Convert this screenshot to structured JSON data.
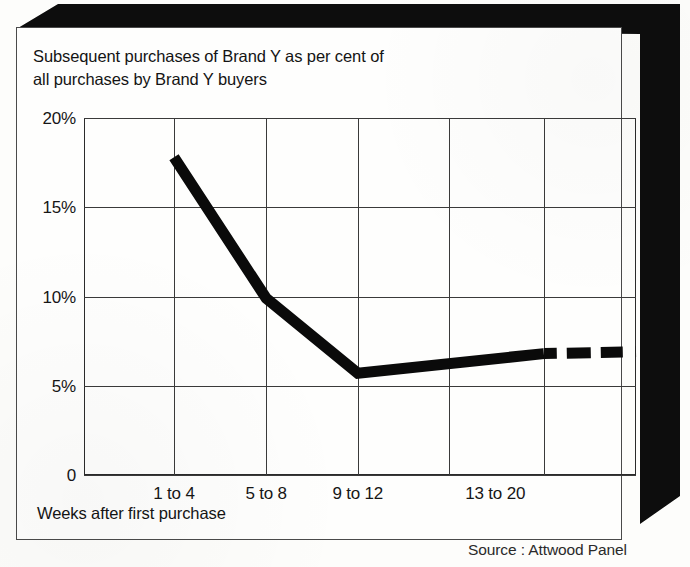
{
  "title": {
    "line1": "Subsequent purchases of Brand Y as per cent of",
    "line2": "all purchases by Brand Y buyers"
  },
  "axis_caption": "Weeks after first purchase",
  "source": "Source : Attwood Panel",
  "colors": {
    "series": "#0a0a0a",
    "grid": "#3a3a3a",
    "frame": "#2b2b2b",
    "card": "#fefefd",
    "shadow": "#0d0d0d",
    "text": "#141414"
  },
  "chart_data": {
    "type": "line",
    "title": "Subsequent purchases of Brand Y as per cent of all purchases by Brand Y buyers",
    "xlabel": "Weeks after first purchase",
    "ylabel": "",
    "source": "Source : Attwood Panel",
    "grid": true,
    "legend": "none",
    "ylim": [
      0,
      20
    ],
    "yticks": [
      0,
      5,
      10,
      15,
      20
    ],
    "ytick_labels": [
      "0",
      "5%",
      "10%",
      "15%",
      "20%"
    ],
    "categories": [
      "1 to 4",
      "5 to 8",
      "9 to 12",
      "13 to 20"
    ],
    "xtick_positions_pct": [
      16.3,
      33.0,
      49.6,
      74.5
    ],
    "gridline_positions_pct": [
      0,
      16.3,
      33.0,
      49.6,
      66.1,
      83.3,
      100
    ],
    "series": [
      {
        "name": "Brand Y repeat purchase rate",
        "style": "thick-solid-with-dashed-projection",
        "points": [
          {
            "x_pct": 16.3,
            "value": 17.8,
            "label": "1 to 4"
          },
          {
            "x_pct": 33.0,
            "value": 9.9,
            "label": "5 to 8"
          },
          {
            "x_pct": 49.6,
            "value": 5.7,
            "label": "9 to 12"
          },
          {
            "x_pct": 83.3,
            "value": 6.8,
            "label": "13 to 20 (solid end)"
          },
          {
            "x_pct": 100.0,
            "value": 6.9,
            "label": "13 to 20 (projected end)"
          }
        ],
        "dashed_from_x_pct": 83.3
      }
    ]
  }
}
